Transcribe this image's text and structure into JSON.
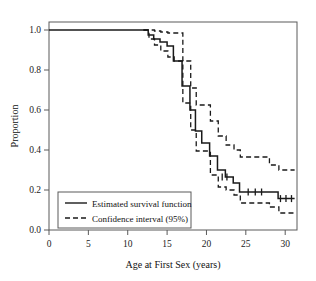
{
  "chart_data": {
    "type": "line",
    "title": "",
    "xlabel": "Age at First Sex (years)",
    "ylabel": "Proportion",
    "xlim": [
      0,
      31.5
    ],
    "ylim": [
      0.0,
      1.04
    ],
    "xticks": [
      0,
      5,
      10,
      15,
      20,
      25,
      30
    ],
    "xtick_labels": [
      "0",
      "5",
      "10",
      "15",
      "20",
      "25",
      "30"
    ],
    "yticks": [
      0.0,
      0.2,
      0.4,
      0.6,
      0.8,
      1.0
    ],
    "ytick_labels": [
      "0.0",
      "0.2",
      "0.4",
      "0.6",
      "0.8",
      "1.0"
    ],
    "grid": false,
    "legend_position": "lower-left",
    "line_color": "#1a1a1a",
    "series": [
      {
        "name": "Estimated survival function",
        "style": "solid",
        "x": [
          0,
          12,
          12.6,
          13.3,
          14.1,
          15.0,
          15.8,
          15.8,
          16.9,
          17.9,
          18.6,
          19.4,
          19.4,
          20.4,
          21.4,
          22.4,
          23.4,
          24.2,
          27.9,
          29.1,
          31.2
        ],
        "y": [
          1.0,
          1.0,
          0.975,
          0.955,
          0.94,
          0.92,
          0.92,
          0.845,
          0.72,
          0.6,
          0.495,
          0.495,
          0.435,
          0.37,
          0.3,
          0.265,
          0.235,
          0.19,
          0.19,
          0.157,
          0.157
        ]
      },
      {
        "name": "Confidence interval (95%) upper",
        "style": "dashed",
        "x": [
          12,
          12.7,
          13.4,
          14.2,
          15.1,
          15.9,
          17.0,
          18.0,
          18.7,
          19.5,
          20.5,
          21.5,
          22.5,
          23.5,
          24.3,
          28.0,
          29.2,
          31.2
        ],
        "y": [
          1.0,
          1.0,
          0.995,
          0.99,
          0.985,
          0.985,
          0.845,
          0.71,
          0.625,
          0.625,
          0.545,
          0.47,
          0.425,
          0.4,
          0.365,
          0.325,
          0.3,
          0.3
        ]
      },
      {
        "name": "Confidence interval (95%) lower",
        "style": "dashed",
        "x": [
          12,
          12.7,
          13.4,
          14.2,
          15.1,
          15.9,
          17.0,
          18.0,
          18.7,
          19.5,
          20.5,
          21.5,
          22.5,
          23.5,
          24.3,
          28.0,
          29.2,
          31.2
        ],
        "y": [
          1.0,
          0.955,
          0.925,
          0.895,
          0.865,
          0.845,
          0.635,
          0.5,
          0.395,
          0.395,
          0.275,
          0.215,
          0.2,
          0.175,
          0.135,
          0.115,
          0.085,
          0.085
        ]
      }
    ],
    "censor_marks": {
      "name": "censoring-ticks",
      "x": [
        22.0,
        22.6,
        25.3,
        26.2,
        27.0,
        29.4,
        30.1,
        30.8
      ],
      "y": [
        0.265,
        0.265,
        0.19,
        0.19,
        0.19,
        0.157,
        0.157,
        0.157
      ]
    },
    "legend": [
      {
        "label": "Estimated survival function",
        "style": "solid"
      },
      {
        "label": "Confidence interval (95%)",
        "style": "dashed"
      }
    ]
  }
}
